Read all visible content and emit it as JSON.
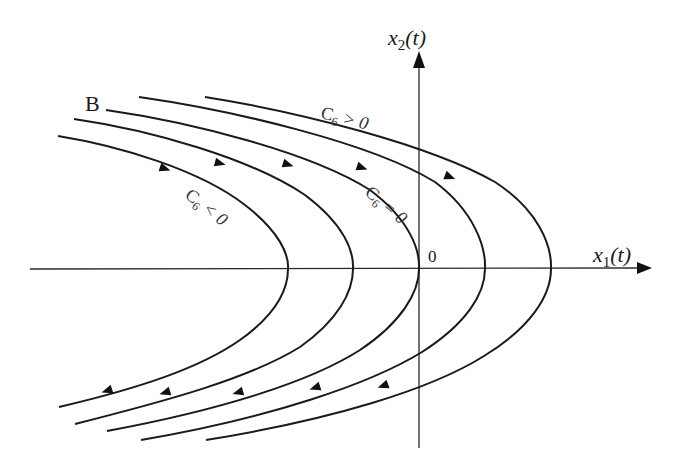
{
  "diagram": {
    "type": "phase-portrait",
    "axes": {
      "x": {
        "var": "x",
        "sub": "1",
        "arg": "(t)"
      },
      "y": {
        "var": "x",
        "sub": "2",
        "arg": "(t)"
      },
      "origin_label": "0"
    },
    "labels": {
      "B": "B",
      "c_pos": {
        "C": "C",
        "sub": "6",
        "rel": " > 0"
      },
      "c_zero": {
        "C": "C",
        "sub": "6",
        "rel": " = 0"
      },
      "c_neg": {
        "C": "C",
        "sub": "6",
        "rel": " < 0"
      }
    },
    "curves": [
      {
        "name": "trajectory-c-neg-2",
        "vertex_x": 288,
        "region": "C6<0"
      },
      {
        "name": "trajectory-c-neg-1",
        "vertex_x": 353,
        "region": "C6<0"
      },
      {
        "name": "trajectory-c-zero-B",
        "vertex_x": 419,
        "region": "C6=0"
      },
      {
        "name": "trajectory-c-pos-1",
        "vertex_x": 485,
        "region": "C6>0"
      },
      {
        "name": "trajectory-c-pos-2",
        "vertex_x": 551,
        "region": "C6>0"
      }
    ],
    "flow_direction": "upper branches move right, lower branches move left"
  }
}
